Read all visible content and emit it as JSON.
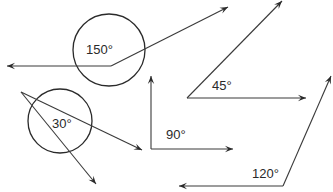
{
  "diagram": {
    "colors": {
      "stroke": "#2a2a2a",
      "background": "#ffffff"
    },
    "angles": [
      {
        "id": "angle-150",
        "label": "150°",
        "measure": 150,
        "vertex": [
          111,
          66
        ],
        "rays": [
          [
            7,
            66
          ],
          [
            228,
            7
          ]
        ],
        "circle": {
          "cx": 109,
          "cy": 50,
          "r": 36
        },
        "label_pos": [
          86,
          54
        ]
      },
      {
        "id": "angle-30",
        "label": "30°",
        "measure": 30,
        "vertex": [
          21,
          92
        ],
        "rays": [
          [
            142,
            150
          ],
          [
            96,
            184
          ]
        ],
        "circle": {
          "cx": 60,
          "cy": 121,
          "r": 32
        },
        "label_pos": [
          52,
          128
        ]
      },
      {
        "id": "angle-90",
        "label": "90°",
        "measure": 90,
        "vertex": [
          151,
          149
        ],
        "rays": [
          [
            151,
            76
          ],
          [
            233,
            149
          ]
        ],
        "label_pos": [
          166,
          139
        ]
      },
      {
        "id": "angle-45",
        "label": "45°",
        "measure": 45,
        "vertex": [
          187,
          98
        ],
        "rays": [
          [
            282,
            1
          ],
          [
            306,
            98
          ]
        ],
        "label_pos": [
          212,
          90
        ]
      },
      {
        "id": "angle-120",
        "label": "120°",
        "measure": 120,
        "vertex": [
          283,
          186
        ],
        "rays": [
          [
            179,
            186
          ],
          [
            331,
            76
          ]
        ],
        "label_pos": [
          252,
          178
        ]
      }
    ]
  }
}
